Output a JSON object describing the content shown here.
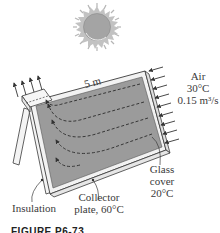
{
  "figure": {
    "type": "solar-air-collector-diagram",
    "caption_partial": "FIGURE P6-73",
    "colors": {
      "plate_fill": "#9a9a9a",
      "frame_fill": "#f2f2f2",
      "line": "#3a3a3a",
      "sun_fill": "#a6a6a6",
      "sun_rays": "#b8b8b8"
    }
  },
  "labels": {
    "length": "5 m",
    "air_inlet": {
      "line1": "Air",
      "line2": "30°C",
      "line3": "0.15 m³/s"
    },
    "glass_cover": {
      "line1": "Glass",
      "line2": "cover",
      "line3": "20°C"
    },
    "insulation": "Insulation",
    "collector_plate": {
      "line1": "Collector",
      "line2": "plate, 60°C"
    }
  },
  "icons": {
    "sun": "sun-icon",
    "inlet_arrows": "arrow-inlet-icon",
    "outlet_arrows": "arrow-outlet-icon",
    "flow_path": "flow-path-icon"
  }
}
